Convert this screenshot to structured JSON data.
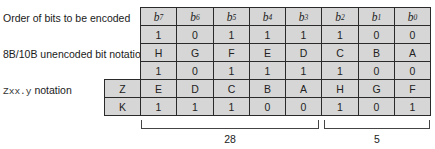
{
  "labels": {
    "order": "Order of bits to be encoded",
    "unencoded": "8B/10B unencoded bit notation",
    "zxx_mono": "Zxx.y",
    "zxx_text": " notation"
  },
  "header": {
    "bits": [
      {
        "base": "b",
        "sub": "7"
      },
      {
        "base": "b",
        "sub": "6"
      },
      {
        "base": "b",
        "sub": "5"
      },
      {
        "base": "b",
        "sub": "4"
      },
      {
        "base": "b",
        "sub": "3"
      },
      {
        "base": "b",
        "sub": "2"
      },
      {
        "base": "b",
        "sub": "1"
      },
      {
        "base": "b",
        "sub": "0"
      }
    ]
  },
  "rows": {
    "order_values": [
      "1",
      "0",
      "1",
      "1",
      "1",
      "1",
      "0",
      "0"
    ],
    "letters": [
      "H",
      "G",
      "F",
      "E",
      "D",
      "C",
      "B",
      "A"
    ],
    "values_repeat": [
      "1",
      "0",
      "1",
      "1",
      "1",
      "1",
      "0",
      "0"
    ],
    "z_row": {
      "key": "Z",
      "cells": [
        "E",
        "D",
        "C",
        "B",
        "A",
        "H",
        "G",
        "F"
      ]
    },
    "k_row": {
      "key": "K",
      "cells": [
        "1",
        "1",
        "1",
        "0",
        "0",
        "1",
        "0",
        "1"
      ]
    }
  },
  "brackets": [
    {
      "label": "28",
      "span": "columns 1-5"
    },
    {
      "label": "5",
      "span": "columns 6-8"
    }
  ],
  "colors": {
    "cell_fill": "#d6d6d6",
    "grid_line": "#2a2a2a",
    "text": "#1a1a1a"
  }
}
